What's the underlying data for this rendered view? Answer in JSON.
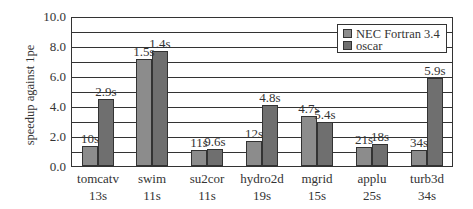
{
  "chart_data": {
    "type": "bar",
    "title": "",
    "xlabel": "",
    "ylabel": "speedup against 1pe",
    "ylim": [
      0,
      10
    ],
    "yticks": [
      "0.0",
      "2.0",
      "4.0",
      "6.0",
      "8.0",
      "10.0"
    ],
    "grid": true,
    "grid_step": 1.0,
    "legend_position": "upper right",
    "categories": [
      "tomcatv",
      "swim",
      "su2cor",
      "hydro2d",
      "mgrid",
      "applu",
      "turb3d"
    ],
    "category_sublabels": [
      "13s",
      "11s",
      "11s",
      "19s",
      "15s",
      "25s",
      "34s"
    ],
    "series": [
      {
        "name": "NEC Fortran 3.4",
        "color": "#8c8c8c",
        "values": [
          1.3,
          7.1,
          1.0,
          1.6,
          3.3,
          1.2,
          1.0
        ],
        "annotations": [
          "10s",
          "1.5s",
          "11s",
          "12s",
          "4.7s",
          "21s",
          "34s"
        ]
      },
      {
        "name": "oscar",
        "color": "#6f6f6f",
        "values": [
          4.4,
          7.6,
          1.1,
          4.0,
          2.9,
          1.4,
          5.8
        ],
        "annotations": [
          "2.9s",
          "1.4s",
          "9.6s",
          "4.8s",
          "5.4s",
          "18s",
          "5.9s"
        ]
      }
    ]
  }
}
